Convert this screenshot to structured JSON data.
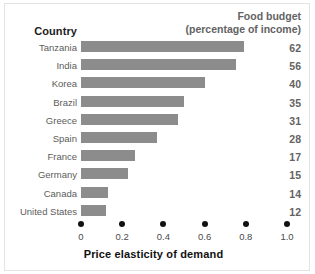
{
  "header": {
    "country_label": "Country",
    "value_header_line1": "Food budget",
    "value_header_line2": "(percentage of income)"
  },
  "axis": {
    "title": "Price elasticity of demand",
    "ticks": [
      "0",
      "0.2",
      "0.4",
      "0.6",
      "0.8",
      "1.0"
    ]
  },
  "colors": {
    "bar": "#8c8c8c",
    "value_text": "#636363",
    "label_text": "#5c5c5c",
    "axis_text": "#111111",
    "background": "#ffffff",
    "frame": "#e3e3e3"
  },
  "rows": [
    {
      "country": "Tanzania",
      "elasticity": 0.79,
      "budget": "62"
    },
    {
      "country": "India",
      "elasticity": 0.75,
      "budget": "56"
    },
    {
      "country": "Korea",
      "elasticity": 0.6,
      "budget": "40"
    },
    {
      "country": "Brazil",
      "elasticity": 0.5,
      "budget": "35"
    },
    {
      "country": "Greece",
      "elasticity": 0.47,
      "budget": "31"
    },
    {
      "country": "Spain",
      "elasticity": 0.37,
      "budget": "28"
    },
    {
      "country": "France",
      "elasticity": 0.26,
      "budget": "17"
    },
    {
      "country": "Germany",
      "elasticity": 0.23,
      "budget": "15"
    },
    {
      "country": "Canada",
      "elasticity": 0.13,
      "budget": "14"
    },
    {
      "country": "United States",
      "elasticity": 0.12,
      "budget": "12"
    }
  ],
  "chart_data": {
    "type": "bar",
    "orientation": "horizontal",
    "title": "",
    "xlabel": "Price elasticity of demand",
    "ylabel": "Country",
    "categories": [
      "Tanzania",
      "India",
      "Korea",
      "Brazil",
      "Greece",
      "Spain",
      "France",
      "Germany",
      "Canada",
      "United States"
    ],
    "values": [
      0.79,
      0.75,
      0.6,
      0.5,
      0.47,
      0.37,
      0.26,
      0.23,
      0.13,
      0.12
    ],
    "xlim": [
      0,
      1.0
    ],
    "xticks": [
      0,
      0.2,
      0.4,
      0.6,
      0.8,
      1.0
    ],
    "xticklabels": [
      "0",
      "0.2",
      "0.4",
      "0.6",
      "0.8",
      "1.0"
    ],
    "grid": false,
    "legend": false,
    "annotation_column": {
      "header": "Food budget (percentage of income)",
      "values": [
        62,
        56,
        40,
        35,
        31,
        28,
        17,
        15,
        14,
        12
      ]
    }
  }
}
